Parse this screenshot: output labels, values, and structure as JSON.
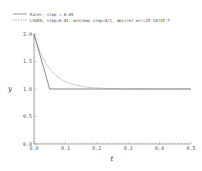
{
  "chart_data": {
    "type": "line",
    "title": "",
    "xlabel": "t",
    "ylabel": "y",
    "xlim": [
      0.0,
      0.5
    ],
    "ylim": [
      0.0,
      2.0
    ],
    "xticks": [
      "0.0",
      "0.1",
      "0.2",
      "0.3",
      "0.4",
      "0.5"
    ],
    "yticks": [
      "0.0",
      "0.5",
      "1.0",
      "1.5",
      "2.0"
    ],
    "grid": false,
    "legend_position": "top-left, above plot",
    "series": [
      {
        "name": "Euler, step = 0.05",
        "style": "solid",
        "x": [
          0.0,
          0.05,
          0.1,
          0.15,
          0.2,
          0.25,
          0.3,
          0.35,
          0.4,
          0.45,
          0.5
        ],
        "y": [
          2.0,
          1.0,
          1.0,
          1.0,
          1.0,
          1.0,
          1.0,
          1.0,
          1.0,
          1.0,
          1.0
        ]
      },
      {
        "name": "LSODA, step=0.01, min/max step=0/1, abs/rel err=1E-10/1E-7",
        "style": "dashed",
        "x": [
          0.0,
          0.01,
          0.02,
          0.03,
          0.04,
          0.05,
          0.06,
          0.07,
          0.08,
          0.09,
          0.1,
          0.12,
          0.14,
          0.16,
          0.18,
          0.2,
          0.25,
          0.3,
          0.35,
          0.4,
          0.45,
          0.5
        ],
        "y": [
          2.0,
          1.819,
          1.67,
          1.549,
          1.449,
          1.368,
          1.301,
          1.247,
          1.202,
          1.165,
          1.135,
          1.091,
          1.061,
          1.041,
          1.027,
          1.018,
          1.007,
          1.002,
          1.001,
          1.0,
          1.0,
          1.0
        ]
      }
    ]
  },
  "legend": {
    "items": [
      {
        "label": "Euler, step = 0.05",
        "style": "solid"
      },
      {
        "label": "LSODA, step=0.01, min/max step=0/1, abs/rel err=1E-10/1E-7",
        "style": "dashed"
      }
    ]
  },
  "colors": {
    "axis": "#777777",
    "euler": "#555555",
    "lsoda": "#888888"
  }
}
